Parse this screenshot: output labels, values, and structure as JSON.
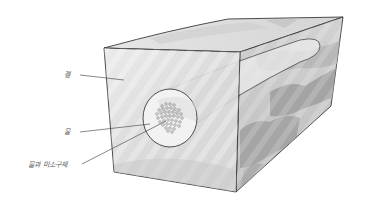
{
  "figure": {
    "labels": {
      "gel": "겔",
      "water": "물",
      "water_and_microspheres": "물과 미소구체"
    },
    "colors": {
      "background": "#ffffff",
      "outline": "#3a3a3a",
      "gel_front": "#dedede",
      "gel_top": "#e3e3e3",
      "gel_side": "#c9c9c9",
      "gel_side_dark": "#9e9e9e",
      "channel_face": "#f1f1f1",
      "microsphere": "#8a8a8a",
      "leader_line": "#555555"
    }
  }
}
